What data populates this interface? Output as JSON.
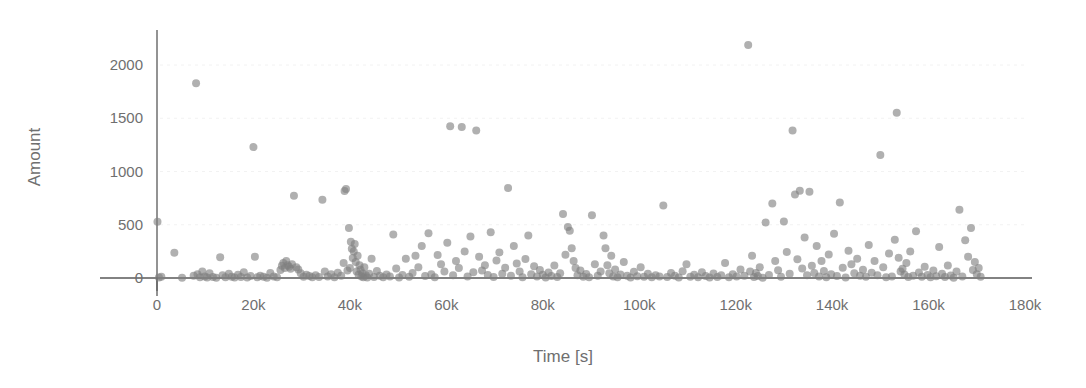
{
  "chart_data": {
    "type": "scatter",
    "title": "",
    "xlabel": "Time [s]",
    "ylabel": "Amount",
    "xlim": [
      -8000,
      182000
    ],
    "ylim": [
      -60,
      2300
    ],
    "grid": true,
    "grid_axis": "y",
    "legend": "none",
    "marker": {
      "shape": "circle",
      "color": "#808080",
      "opacity": 0.62,
      "size_px": 8
    },
    "xticks": [
      0,
      20000,
      40000,
      60000,
      80000,
      100000,
      120000,
      140000,
      160000,
      180000
    ],
    "xticklabels": [
      "0",
      "20k",
      "40k",
      "60k",
      "80k",
      "100k",
      "120k",
      "140k",
      "160k",
      "180k"
    ],
    "yticks": [
      0,
      500,
      1000,
      1500,
      2000
    ],
    "yticklabels": [
      "0",
      "500",
      "1000",
      "1500",
      "2000"
    ],
    "series": [
      {
        "name": "transactions",
        "points": [
          [
            100,
            529
          ],
          [
            400,
            5
          ],
          [
            900,
            12
          ],
          [
            3600,
            238
          ],
          [
            5200,
            3
          ],
          [
            7600,
            20
          ],
          [
            8100,
            1828
          ],
          [
            8400,
            35
          ],
          [
            8900,
            8
          ],
          [
            9400,
            60
          ],
          [
            9900,
            15
          ],
          [
            10400,
            5
          ],
          [
            10900,
            45
          ],
          [
            11600,
            10
          ],
          [
            12300,
            3
          ],
          [
            13100,
            196
          ],
          [
            13600,
            25
          ],
          [
            14200,
            8
          ],
          [
            14900,
            40
          ],
          [
            15500,
            12
          ],
          [
            16100,
            5
          ],
          [
            16800,
            30
          ],
          [
            17400,
            9
          ],
          [
            18000,
            55
          ],
          [
            18700,
            4
          ],
          [
            19400,
            18
          ],
          [
            20000,
            1229
          ],
          [
            20300,
            200
          ],
          [
            20800,
            7
          ],
          [
            21400,
            22
          ],
          [
            22100,
            11
          ],
          [
            22800,
            3
          ],
          [
            23500,
            48
          ],
          [
            24200,
            14
          ],
          [
            24900,
            6
          ],
          [
            25600,
            75
          ],
          [
            25900,
            115
          ],
          [
            26200,
            140
          ],
          [
            26500,
            95
          ],
          [
            26800,
            160
          ],
          [
            27100,
            120
          ],
          [
            27400,
            105
          ],
          [
            27700,
            88
          ],
          [
            28000,
            130
          ],
          [
            28400,
            772
          ],
          [
            28900,
            100
          ],
          [
            29300,
            80
          ],
          [
            29800,
            45
          ],
          [
            30400,
            12
          ],
          [
            31000,
            30
          ],
          [
            31600,
            18
          ],
          [
            32200,
            8
          ],
          [
            32900,
            25
          ],
          [
            33600,
            10
          ],
          [
            34300,
            735
          ],
          [
            34800,
            60
          ],
          [
            35400,
            15
          ],
          [
            36100,
            35
          ],
          [
            36800,
            6
          ],
          [
            37500,
            50
          ],
          [
            38200,
            20
          ],
          [
            38700,
            140
          ],
          [
            38900,
            818
          ],
          [
            39200,
            836
          ],
          [
            39500,
            70
          ],
          [
            39800,
            470
          ],
          [
            40000,
            95
          ],
          [
            40200,
            340
          ],
          [
            40400,
            275
          ],
          [
            40600,
            188
          ],
          [
            40800,
            250
          ],
          [
            41000,
            320
          ],
          [
            41200,
            150
          ],
          [
            41400,
            60
          ],
          [
            41600,
            210
          ],
          [
            41800,
            30
          ],
          [
            42000,
            120
          ],
          [
            42200,
            78
          ],
          [
            42400,
            15
          ],
          [
            42600,
            45
          ],
          [
            42800,
            8
          ],
          [
            43000,
            100
          ],
          [
            43300,
            25
          ],
          [
            43600,
            5
          ],
          [
            44000,
            40
          ],
          [
            44500,
            180
          ],
          [
            45000,
            10
          ],
          [
            45600,
            65
          ],
          [
            46200,
            22
          ],
          [
            46900,
            7
          ],
          [
            47600,
            33
          ],
          [
            48300,
            14
          ],
          [
            49000,
            408
          ],
          [
            49600,
            90
          ],
          [
            50200,
            5
          ],
          [
            50900,
            27
          ],
          [
            51600,
            180
          ],
          [
            52300,
            12
          ],
          [
            53000,
            48
          ],
          [
            53600,
            210
          ],
          [
            54200,
            100
          ],
          [
            54900,
            300
          ],
          [
            55600,
            18
          ],
          [
            56300,
            420
          ],
          [
            56900,
            35
          ],
          [
            57600,
            8
          ],
          [
            58200,
            215
          ],
          [
            58900,
            130
          ],
          [
            59600,
            60
          ],
          [
            60200,
            330
          ],
          [
            60800,
            1424
          ],
          [
            61400,
            25
          ],
          [
            62000,
            160
          ],
          [
            62600,
            95
          ],
          [
            63200,
            1418
          ],
          [
            63800,
            250
          ],
          [
            64400,
            15
          ],
          [
            65000,
            390
          ],
          [
            65600,
            55
          ],
          [
            66200,
            1385
          ],
          [
            66800,
            200
          ],
          [
            67400,
            70
          ],
          [
            68000,
            120
          ],
          [
            68600,
            28
          ],
          [
            69200,
            430
          ],
          [
            69800,
            10
          ],
          [
            70400,
            165
          ],
          [
            71000,
            240
          ],
          [
            71600,
            40
          ],
          [
            72200,
            96
          ],
          [
            72800,
            844
          ],
          [
            73400,
            22
          ],
          [
            74000,
            300
          ],
          [
            74600,
            135
          ],
          [
            75200,
            62
          ],
          [
            75800,
            8
          ],
          [
            76400,
            178
          ],
          [
            77000,
            400
          ],
          [
            77600,
            35
          ],
          [
            78200,
            110
          ],
          [
            78800,
            14
          ],
          [
            79400,
            75
          ],
          [
            80000,
            30
          ],
          [
            80600,
            5
          ],
          [
            81200,
            52
          ],
          [
            81800,
            19
          ],
          [
            82400,
            118
          ],
          [
            83000,
            9
          ],
          [
            83600,
            44
          ],
          [
            84200,
            600
          ],
          [
            84700,
            218
          ],
          [
            85200,
            480
          ],
          [
            85600,
            443
          ],
          [
            86000,
            280
          ],
          [
            86400,
            160
          ],
          [
            86800,
            95
          ],
          [
            87200,
            26
          ],
          [
            87800,
            70
          ],
          [
            88400,
            12
          ],
          [
            89000,
            38
          ],
          [
            89600,
            6
          ],
          [
            90200,
            590
          ],
          [
            90800,
            130
          ],
          [
            91400,
            20
          ],
          [
            92000,
            60
          ],
          [
            92600,
            400
          ],
          [
            93000,
            280
          ],
          [
            93400,
            120
          ],
          [
            93800,
            45
          ],
          [
            94200,
            210
          ],
          [
            94600,
            15
          ],
          [
            95000,
            80
          ],
          [
            95500,
            8
          ],
          [
            96100,
            33
          ],
          [
            96800,
            150
          ],
          [
            97500,
            22
          ],
          [
            98200,
            5
          ],
          [
            98900,
            58
          ],
          [
            99600,
            17
          ],
          [
            100300,
            100
          ],
          [
            101000,
            11
          ],
          [
            101800,
            40
          ],
          [
            102600,
            7
          ],
          [
            103400,
            25
          ],
          [
            104200,
            14
          ],
          [
            105000,
            680
          ],
          [
            105800,
            9
          ],
          [
            106600,
            48
          ],
          [
            107400,
            20
          ],
          [
            108200,
            5
          ],
          [
            109000,
            64
          ],
          [
            109800,
            130
          ],
          [
            110600,
            12
          ],
          [
            111400,
            30
          ],
          [
            112200,
            8
          ],
          [
            113000,
            55
          ],
          [
            113800,
            18
          ],
          [
            114600,
            4
          ],
          [
            115400,
            42
          ],
          [
            116200,
            10
          ],
          [
            117000,
            26
          ],
          [
            117800,
            140
          ],
          [
            118600,
            6
          ],
          [
            119400,
            35
          ],
          [
            120200,
            15
          ],
          [
            121000,
            80
          ],
          [
            121800,
            22
          ],
          [
            122600,
            2188
          ],
          [
            123000,
            60
          ],
          [
            123400,
            210
          ],
          [
            123800,
            9
          ],
          [
            124200,
            47
          ],
          [
            124600,
            18
          ],
          [
            125000,
            100
          ],
          [
            125600,
            3
          ],
          [
            126200,
            520
          ],
          [
            126900,
            28
          ],
          [
            127600,
            700
          ],
          [
            128200,
            160
          ],
          [
            128800,
            72
          ],
          [
            129400,
            12
          ],
          [
            130000,
            530
          ],
          [
            130600,
            245
          ],
          [
            131200,
            40
          ],
          [
            131800,
            1384
          ],
          [
            132300,
            785
          ],
          [
            132800,
            175
          ],
          [
            133300,
            820
          ],
          [
            133800,
            90
          ],
          [
            134300,
            380
          ],
          [
            134800,
            25
          ],
          [
            135300,
            810
          ],
          [
            135800,
            115
          ],
          [
            136300,
            48
          ],
          [
            136800,
            300
          ],
          [
            137300,
            14
          ],
          [
            137800,
            160
          ],
          [
            138300,
            66
          ],
          [
            138800,
            8
          ],
          [
            139300,
            220
          ],
          [
            139800,
            35
          ],
          [
            140400,
            415
          ],
          [
            141000,
            18
          ],
          [
            141600,
            710
          ],
          [
            142200,
            96
          ],
          [
            142800,
            5
          ],
          [
            143400,
            255
          ],
          [
            144000,
            130
          ],
          [
            144600,
            44
          ],
          [
            145200,
            180
          ],
          [
            145800,
            20
          ],
          [
            146400,
            78
          ],
          [
            147000,
            11
          ],
          [
            147600,
            310
          ],
          [
            148200,
            50
          ],
          [
            148800,
            160
          ],
          [
            149400,
            26
          ],
          [
            150000,
            1156
          ],
          [
            150600,
            100
          ],
          [
            151200,
            7
          ],
          [
            151800,
            230
          ],
          [
            152400,
            15
          ],
          [
            153000,
            360
          ],
          [
            153400,
            1551
          ],
          [
            153800,
            190
          ],
          [
            154200,
            60
          ],
          [
            154600,
            86
          ],
          [
            155000,
            32
          ],
          [
            155400,
            140
          ],
          [
            155800,
            9
          ],
          [
            156200,
            250
          ],
          [
            156800,
            21
          ],
          [
            157400,
            440
          ],
          [
            158000,
            52
          ],
          [
            158600,
            12
          ],
          [
            159200,
            105
          ],
          [
            159800,
            28
          ],
          [
            160400,
            6
          ],
          [
            161000,
            70
          ],
          [
            161600,
            17
          ],
          [
            162200,
            290
          ],
          [
            162800,
            40
          ],
          [
            163400,
            9
          ],
          [
            164000,
            118
          ],
          [
            164600,
            24
          ],
          [
            165200,
            3
          ],
          [
            165800,
            62
          ],
          [
            166400,
            640
          ],
          [
            167000,
            15
          ],
          [
            167600,
            355
          ],
          [
            168200,
            200
          ],
          [
            168800,
            470
          ],
          [
            169200,
            75
          ],
          [
            169600,
            150
          ],
          [
            170000,
            36
          ],
          [
            170400,
            95
          ],
          [
            170800,
            11
          ]
        ]
      }
    ]
  },
  "axes": {
    "x_title": "Time [s]",
    "y_title": "Amount"
  }
}
